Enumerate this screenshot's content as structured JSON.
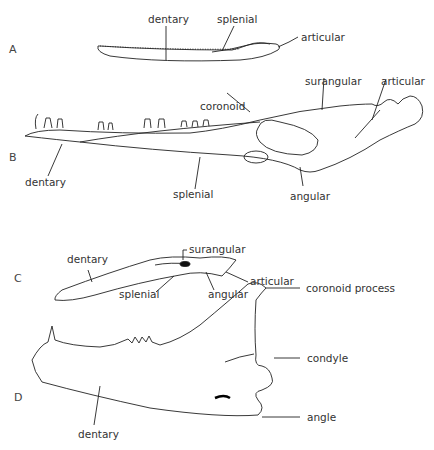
{
  "panels": {
    "A": {
      "letter": "A",
      "labels": {
        "dentary": "dentary",
        "splenial": "splenial",
        "articular": "articular"
      }
    },
    "B": {
      "letter": "B",
      "labels": {
        "coronoid": "coronoid",
        "surangular": "surangular",
        "articular": "articular",
        "dentary": "dentary",
        "splenial": "splenial",
        "angular": "angular"
      }
    },
    "C": {
      "letter": "C",
      "labels": {
        "surangular": "surangular",
        "dentary": "dentary",
        "articular": "articular",
        "splenial": "splenial",
        "angular": "angular"
      }
    },
    "D": {
      "letter": "D",
      "labels": {
        "coronoid_process": "coronoid process",
        "condyle": "condyle",
        "angle": "angle",
        "dentary": "dentary"
      }
    }
  }
}
